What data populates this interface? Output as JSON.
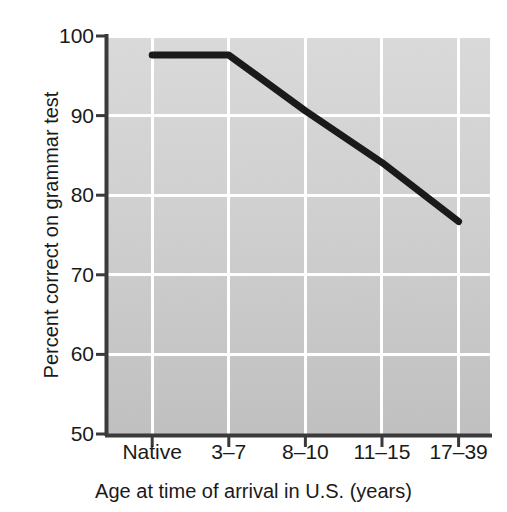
{
  "chart_data": {
    "type": "line",
    "title": "",
    "xlabel": "Age at time of arrival in U.S. (years)",
    "ylabel": "Percent correct on grammar test",
    "categories": [
      "Native",
      "3–7",
      "8–10",
      "11–15",
      "17–39"
    ],
    "values": [
      97.6,
      97.6,
      90.6,
      84.1,
      76.7
    ],
    "series": [
      {
        "name": "Percent correct on grammar test",
        "values": [
          97.6,
          97.6,
          90.6,
          84.1,
          76.7
        ]
      }
    ],
    "ylim": [
      50,
      100
    ],
    "yticks": [
      50,
      60,
      70,
      80,
      90,
      100
    ],
    "ytick_labels": [
      "50",
      "60",
      "70",
      "80",
      "90",
      "100"
    ],
    "grid": true,
    "grid_color": "#ffffff",
    "legend": false,
    "legend_position": "none",
    "line_color": "#1a1a1a",
    "plot_background_top": "#d6d6d6",
    "plot_background_bottom": "#c2c2c2",
    "axis_color": "#3a3a3a",
    "text_color": "#1a1a1a",
    "page_background": "#ffffff"
  },
  "axes": {
    "y_title": "Percent correct on grammar test",
    "x_title": "Age at time of arrival in U.S. (years)"
  }
}
